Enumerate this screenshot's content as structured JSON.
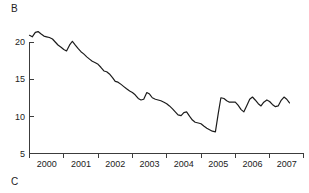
{
  "figure": {
    "panel_label_top": "B",
    "panel_label_bottom": "C"
  },
  "chart_data": {
    "type": "line",
    "title": "",
    "xlabel": "",
    "ylabel": "",
    "xlim": [
      2000.0,
      2007.8
    ],
    "ylim": [
      5,
      22.5
    ],
    "yticks": [
      5,
      10,
      15,
      20
    ],
    "ytick_labels": [
      "5",
      "10",
      "15",
      "20"
    ],
    "xticks": [
      2000,
      2001,
      2002,
      2003,
      2004,
      2005,
      2006,
      2007,
      2008
    ],
    "xtick_labels": [
      "2000",
      "2001",
      "2002",
      "2003",
      "2004",
      "2005",
      "2006",
      "2007"
    ],
    "grid": false,
    "legend": null,
    "line_color": "#1c1c1c",
    "series": [
      {
        "name": "rate",
        "x": [
          2000.0,
          2000.08,
          2000.17,
          2000.25,
          2000.33,
          2000.42,
          2000.5,
          2000.58,
          2000.67,
          2000.75,
          2000.83,
          2000.92,
          2001.0,
          2001.08,
          2001.17,
          2001.25,
          2001.33,
          2001.42,
          2001.5,
          2001.58,
          2001.67,
          2001.75,
          2001.83,
          2001.92,
          2002.0,
          2002.08,
          2002.17,
          2002.25,
          2002.33,
          2002.42,
          2002.5,
          2002.58,
          2002.67,
          2002.75,
          2002.83,
          2002.92,
          2003.0,
          2003.08,
          2003.17,
          2003.25,
          2003.33,
          2003.42,
          2003.5,
          2003.58,
          2003.67,
          2003.75,
          2003.83,
          2003.92,
          2004.0,
          2004.08,
          2004.17,
          2004.25,
          2004.33,
          2004.42,
          2004.5,
          2004.58,
          2004.67,
          2004.75,
          2004.83,
          2004.92,
          2005.0,
          2005.08,
          2005.17,
          2005.25,
          2005.33,
          2005.42,
          2005.5,
          2005.58,
          2005.67,
          2005.75,
          2005.83,
          2005.92,
          2006.0,
          2006.08,
          2006.17,
          2006.25,
          2006.33,
          2006.42,
          2006.5,
          2006.58,
          2006.67,
          2006.75,
          2006.83,
          2006.92,
          2007.0,
          2007.08,
          2007.17,
          2007.25,
          2007.33,
          2007.42,
          2007.5,
          2007.58
        ],
        "values": [
          20.9,
          20.7,
          21.3,
          21.4,
          21.1,
          20.8,
          20.7,
          20.6,
          20.4,
          20.0,
          19.6,
          19.3,
          19.0,
          18.8,
          19.6,
          20.1,
          19.6,
          19.1,
          18.7,
          18.4,
          18.0,
          17.7,
          17.4,
          17.2,
          17.0,
          16.6,
          16.1,
          16.0,
          15.7,
          15.2,
          14.7,
          14.6,
          14.3,
          14.0,
          13.7,
          13.4,
          13.2,
          12.9,
          12.4,
          12.2,
          12.3,
          13.2,
          13.0,
          12.5,
          12.3,
          12.2,
          12.1,
          11.9,
          11.7,
          11.4,
          11.0,
          10.6,
          10.2,
          10.1,
          10.5,
          10.6,
          10.0,
          9.5,
          9.2,
          9.1,
          9.0,
          8.7,
          8.4,
          8.2,
          8.0,
          7.9,
          10.3,
          12.5,
          12.4,
          12.1,
          11.9,
          11.9,
          11.9,
          11.5,
          10.9,
          10.6,
          11.4,
          12.3,
          12.6,
          12.2,
          11.7,
          11.4,
          11.9,
          12.2,
          12.0,
          11.6,
          11.3,
          11.4,
          12.1,
          12.6,
          12.3,
          11.8
        ]
      }
    ]
  }
}
